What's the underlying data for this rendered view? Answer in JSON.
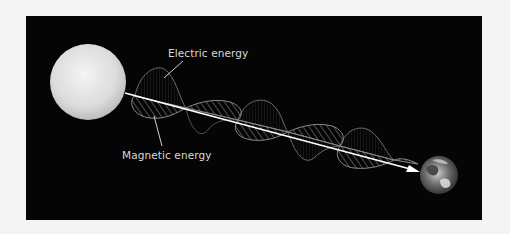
{
  "diagram": {
    "labels": {
      "electric": "Electric energy",
      "magnetic": "Magnetic energy"
    },
    "source_object": "sun",
    "target_object": "earth",
    "colors": {
      "background": "#050505",
      "page": "#f4f4f4",
      "arrow": "#ffffff",
      "wave": "#8a8a8a",
      "label": "#d8d8d8"
    }
  }
}
